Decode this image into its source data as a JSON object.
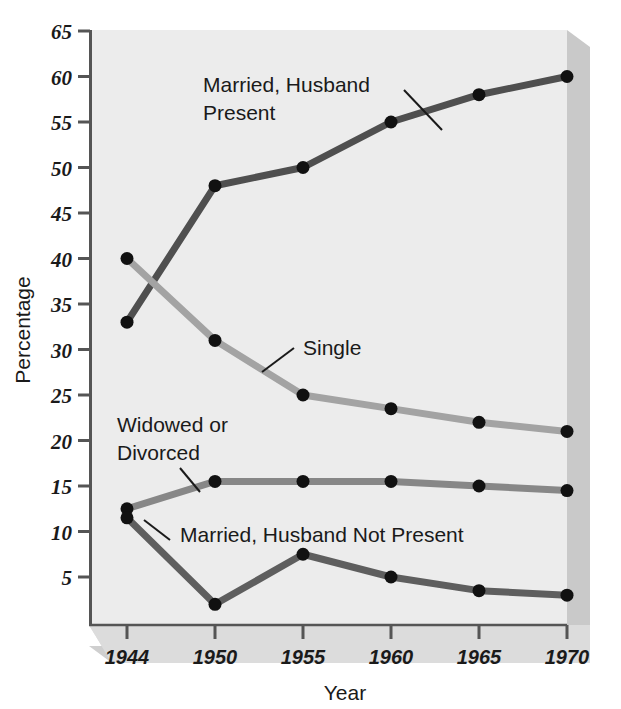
{
  "chart_data": {
    "type": "line",
    "title": "",
    "xlabel": "Year",
    "ylabel": "Percentage",
    "x": [
      1944,
      1950,
      1955,
      1960,
      1965,
      1970
    ],
    "categories": [
      "1944",
      "1950",
      "1955",
      "1960",
      "1965",
      "1970"
    ],
    "xlim": [
      1944,
      1970
    ],
    "ylim": [
      0,
      65
    ],
    "y_ticks": [
      5,
      10,
      15,
      20,
      25,
      30,
      35,
      40,
      45,
      50,
      55,
      60,
      65
    ],
    "y_tick_labels": [
      "5",
      "10",
      "15",
      "20",
      "25",
      "30",
      "35",
      "40",
      "45",
      "50",
      "55",
      "60",
      "65"
    ],
    "grid": false,
    "legend": "annotations-inline",
    "series": [
      {
        "name": "Married, Husband Present",
        "color": "#4f4f4f",
        "values": [
          33,
          48,
          50,
          55,
          58,
          60
        ]
      },
      {
        "name": "Single",
        "color": "#a3a3a3",
        "values": [
          40,
          31,
          25,
          23.5,
          22,
          21
        ]
      },
      {
        "name": "Widowed or Divorced",
        "color": "#878787",
        "values": [
          12.5,
          15.5,
          15.5,
          15.5,
          15,
          14.5
        ]
      },
      {
        "name": "Married, Husband Not Present",
        "color": "#5e5e5e",
        "values": [
          11.5,
          2,
          7.5,
          5,
          3.5,
          3
        ]
      }
    ],
    "annotations": [
      {
        "text_line1": "Married, Husband",
        "text_line2": "Present",
        "series": "Married, Husband Present"
      },
      {
        "text_line1": "Single",
        "text_line2": "",
        "series": "Single"
      },
      {
        "text_line1": "Widowed or",
        "text_line2": "Divorced",
        "series": "Widowed or Divorced"
      },
      {
        "text_line1": "Married, Husband Not Present",
        "text_line2": "",
        "series": "Married, Husband Not Present"
      }
    ],
    "colors": {
      "plot_background": "#ececec",
      "shadow": "#c8c8c8",
      "axis": "#555555",
      "marker": "#111111"
    }
  },
  "labels": {
    "y_axis_title": "Percentage",
    "x_axis_title": "Year",
    "y_tick_65": "65",
    "y_tick_60": "60",
    "y_tick_55": "55",
    "y_tick_50": "50",
    "y_tick_45": "45",
    "y_tick_40": "40",
    "y_tick_35": "35",
    "y_tick_30": "30",
    "y_tick_25": "25",
    "y_tick_20": "20",
    "y_tick_15": "15",
    "y_tick_10": "10",
    "y_tick_5": "5",
    "x_tick_1944": "1944",
    "x_tick_1950": "1950",
    "x_tick_1955": "1955",
    "x_tick_1960": "1960",
    "x_tick_1965": "1965",
    "x_tick_1970": "1970",
    "ann_married_present_1": "Married, Husband",
    "ann_married_present_2": "Present",
    "ann_single": "Single",
    "ann_widowed_1": "Widowed or",
    "ann_widowed_2": "Divorced",
    "ann_married_not_present": "Married, Husband Not Present"
  }
}
